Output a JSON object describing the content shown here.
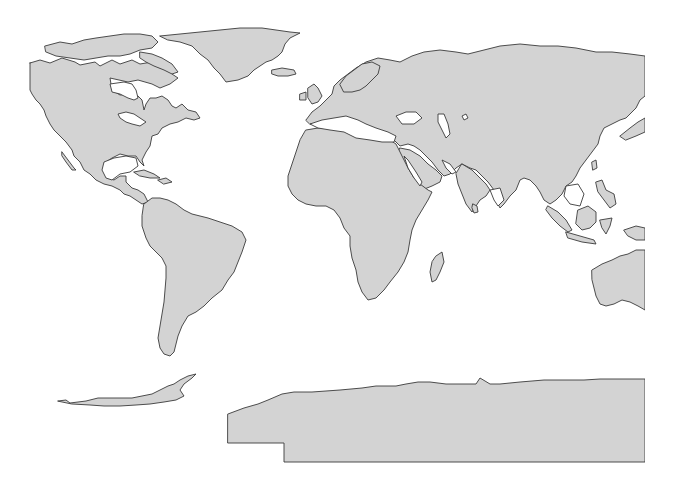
{
  "map": {
    "width": 674,
    "height": 478,
    "background": "#ffffff",
    "land_fill": "#d3d3d3",
    "outline_color": "#3a3a3a",
    "outline_width": 0.9,
    "water_fill": "#ffffff",
    "clip": {
      "x": 0,
      "y": 0,
      "width": 645,
      "height": 478
    },
    "labels": [],
    "landmasses": [
      {
        "name": "north-america",
        "d": "M30,63 L40,60 L50,63 L62,58 L75,62 L80,65 L95,62 L100,66 L112,60 L120,64 L132,60 L140,64 L152,62 L160,68 L168,66 L172,74 L178,78 L170,84 L160,88 L152,84 L138,80 L128,82 L110,78 L112,90 L120,95 L130,94 L138,96 L142,100 L144,110 L146,104 L150,98 L156,98 L162,96 L168,100 L172,106 L176,108 L182,104 L188,110 L196,112 L200,118 L194,120 L186,118 L178,122 L170,124 L162,128 L158,134 L152,136 L150,146 L146,152 L142,160 L144,166 L140,162 L136,156 L128,156 L120,154 L112,158 L106,162 L104,170 L108,178 L114,180 L120,176 L126,176 L126,182 L132,188 L138,190 L144,194 L148,202 L142,204 L136,200 L130,196 L124,194 L120,190 L112,186 L104,184 L96,180 L90,174 L84,170 L80,162 L74,156 L72,150 L66,142 L60,136 L54,130 L50,124 L46,116 L44,110 L40,104 L36,100 L32,94 L30,90 L30,63 Z"
      },
      {
        "name": "baja-california",
        "d": "M62,152 L68,160 L74,168 L76,170 L72,170 L66,162 L62,156 Z"
      },
      {
        "name": "greenland",
        "d": "M160,36 L180,34 L200,32 L220,30 L240,28 L262,28 L290,32 L300,33 L290,38 L285,44 L282,52 L278,56 L272,60 L266,62 L260,66 L254,70 L248,76 L238,80 L226,82 L220,74 L214,68 L208,60 L200,54 L192,46 L180,42 L168,40 Z"
      },
      {
        "name": "canadian-arctic-islands",
        "d": "M45,46 L60,42 L72,44 L84,40 L96,38 L110,36 L124,34 L140,34 L152,36 L158,42 L152,48 L140,50 L130,54 L120,56 L108,56 L96,58 L84,60 L70,58 L56,56 L46,52 Z"
      },
      {
        "name": "baffin-island",
        "d": "M140,52 L152,54 L162,58 L172,64 L178,72 L172,74 L164,70 L154,66 L146,62 L140,58 Z"
      },
      {
        "name": "iceland",
        "d": "M272,70 L282,68 L294,70 L296,74 L288,76 L278,76 L272,74 Z"
      },
      {
        "name": "cuba",
        "d": "M134,172 L144,170 L154,174 L160,178 L150,178 L140,176 Z"
      },
      {
        "name": "hispaniola",
        "d": "M158,180 L166,178 L172,182 L164,184 Z"
      },
      {
        "name": "south-america",
        "d": "M144,204 L152,198 L160,198 L168,200 L176,204 L184,210 L192,214 L200,216 L208,218 L220,222 L232,226 L242,232 L246,240 L242,252 L238,262 L234,272 L228,280 L222,290 L212,298 L204,306 L196,312 L188,316 L182,326 L178,336 L176,344 L174,352 L170,356 L164,354 L160,348 L158,338 L160,326 L162,314 L164,302 L165,290 L166,278 L166,266 L162,258 L156,252 L150,246 L146,238 L142,226 L142,216 Z"
      },
      {
        "name": "europe-asia",
        "d": "M306,120 L312,112 L320,106 L326,100 L332,94 L334,86 L340,80 L348,74 L356,68 L366,62 L378,58 L390,60 L400,62 L412,56 L424,52 L440,50 L456,52 L468,54 L484,50 L500,46 L520,44 L540,46 L558,46 L576,48 L596,52 L612,52 L630,54 L645,56 L645,96 L640,100 L636,108 L630,114 L626,118 L620,120 L612,124 L604,128 L600,136 L598,144 L592,152 L586,160 L580,168 L576,176 L572,182 L566,186 L562,194 L556,200 L550,204 L544,200 L540,192 L536,186 L530,180 L524,178 L520,180 L516,190 L510,196 L504,204 L500,208 L496,200 L494,190 L488,182 L482,176 L476,170 L470,168 L462,164 L456,168 L450,174 L444,176 L438,170 L432,162 L426,156 L420,150 L414,146 L408,144 L400,146 L394,140 L388,136 L380,134 L372,134 L364,132 L356,130 L346,128 L338,128 L328,126 L318,124 L310,124 Z"
      },
      {
        "name": "arabia",
        "d": "M400,148 L410,150 L420,156 L428,164 L436,170 L442,176 L440,182 L432,186 L422,190 L414,194 L408,188 L404,180 L400,170 L396,160 Z"
      },
      {
        "name": "indian-subcontinent",
        "d": "M462,164 L472,170 L480,178 L486,184 L490,190 L486,196 L480,200 L476,206 L472,212 L466,204 L462,194 L458,184 L456,174 Z"
      },
      {
        "name": "sri-lanka",
        "d": "M473,204 L477,206 L478,212 L474,213 L472,208 Z"
      },
      {
        "name": "great-britain",
        "d": "M308,88 L314,84 L318,88 L322,96 L318,102 L312,104 L308,98 Z"
      },
      {
        "name": "ireland",
        "d": "M300,94 L306,92 L306,100 L300,100 Z"
      },
      {
        "name": "scandinavia",
        "d": "M340,84 L346,76 L354,70 L362,64 L372,62 L380,66 L378,74 L372,80 L366,86 L360,90 L352,92 L344,92 Z"
      },
      {
        "name": "africa",
        "d": "M306,130 L318,128 L330,128 L342,130 L354,136 L366,138 L378,138 L390,140 L396,144 L402,156 L408,168 L414,178 L420,184 L428,190 L432,192 L428,200 L422,210 L416,220 L412,230 L410,240 L408,252 L404,262 L398,272 L390,282 L384,290 L376,298 L368,300 L362,292 L358,282 L356,270 L352,258 L350,246 L350,236 L344,228 L340,218 L334,210 L326,206 L316,206 L306,204 L298,200 L292,194 L288,186 L288,176 L292,164 L296,152 L300,140 Z"
      },
      {
        "name": "madagascar",
        "d": "M436,256 L442,252 L444,262 L440,272 L436,280 L432,282 L430,272 L432,262 Z"
      },
      {
        "name": "japan",
        "d": "M620,136 L630,128 L638,122 L645,118 L645,132 L636,136 L626,140 Z"
      },
      {
        "name": "taiwan",
        "d": "M592,162 L596,160 L597,168 L593,170 Z"
      },
      {
        "name": "philippines",
        "d": "M596,182 L602,180 L606,190 L614,194 L616,204 L610,208 L604,200 L598,192 Z"
      },
      {
        "name": "sumatra",
        "d": "M548,206 L558,212 L566,220 L572,230 L568,232 L560,226 L552,218 L546,210 Z"
      },
      {
        "name": "java",
        "d": "M566,232 L580,236 L594,240 L596,244 L582,242 L568,238 Z"
      },
      {
        "name": "borneo",
        "d": "M578,210 L588,206 L596,212 L596,222 L590,228 L582,230 L576,224 Z"
      },
      {
        "name": "sulawesi",
        "d": "M600,220 L612,218 L610,226 L606,234 L602,228 Z"
      },
      {
        "name": "new-guinea",
        "d": "M624,230 L636,226 L645,228 L645,240 L636,240 L628,236 Z"
      },
      {
        "name": "australia",
        "d": "M592,270 L602,264 L612,260 L620,256 L628,254 L636,250 L645,250 L645,310 L638,306 L630,302 L622,300 L614,304 L606,306 L600,304 L596,296 L594,288 L592,280 Z"
      },
      {
        "name": "antarctic-peninsula",
        "d": "M58,401 L66,400 L70,403 L78,402 L86,401 L98,398 L110,398 L120,398 L132,398 L142,396 L152,394 L160,390 L168,386 L174,384 L180,380 L188,376 L196,374 L192,378 L184,384 L180,390 L184,396 L176,400 L164,402 L150,404 L136,405 L120,406 L104,406 L90,405 L72,404 Z"
      },
      {
        "name": "antarctica",
        "d": "M228,414 L244,408 L258,404 L268,400 L282,394 L294,392 L312,392 L340,390 L362,388 L376,386 L384,386 L396,386 L406,384 L418,382 L430,382 L446,384 L460,384 L476,384 L480,378 L490,384 L500,384 L520,382 L544,380 L568,380 L584,380 L600,379 L616,379 L630,379 L645,379 L645,462 L284,462 L284,443 L228,443 Z"
      }
    ],
    "lakes": [
      {
        "name": "hudson-bay",
        "d": "M110,84 L124,82 L132,84 L136,90 L138,98 L134,100 L128,98 L120,94 L112,92 Z"
      },
      {
        "name": "great-lakes",
        "d": "M118,114 L126,112 L134,114 L140,118 L146,122 L140,126 L132,124 L126,122 L120,118 Z"
      },
      {
        "name": "gulf-of-mexico",
        "d": "M104,162 L114,158 L126,156 L136,158 L138,166 L130,172 L120,174 L112,180 L106,178 L102,170 Z"
      },
      {
        "name": "mediterranean-sea",
        "d": "M310,124 L322,120 L334,118 L346,116 L358,120 L366,124 L376,128 L388,132 L396,136 L394,142 L382,142 L370,140 L356,138 L344,132 L330,130 L318,128 Z"
      },
      {
        "name": "black-sea",
        "d": "M396,116 L406,112 L416,112 L422,118 L414,124 L402,124 Z"
      },
      {
        "name": "caspian-sea",
        "d": "M438,114 L444,114 L448,124 L450,134 L446,138 L442,130 L438,122 Z"
      },
      {
        "name": "aral-sea",
        "d": "M462,116 L466,114 L468,118 L464,120 Z"
      },
      {
        "name": "red-sea",
        "d": "M404,156 L408,160 L416,172 L422,182 L420,186 L414,178 L408,168 Z"
      },
      {
        "name": "persian-gulf",
        "d": "M442,160 L450,164 L456,172 L452,174 L446,168 Z"
      },
      {
        "name": "bay-of-bengal",
        "d": "M490,190 L500,188 L504,200 L498,206 L494,200 Z"
      },
      {
        "name": "south-china-sea",
        "d": "M566,186 L578,184 L584,194 L580,206 L570,204 L564,196 Z"
      }
    ]
  }
}
